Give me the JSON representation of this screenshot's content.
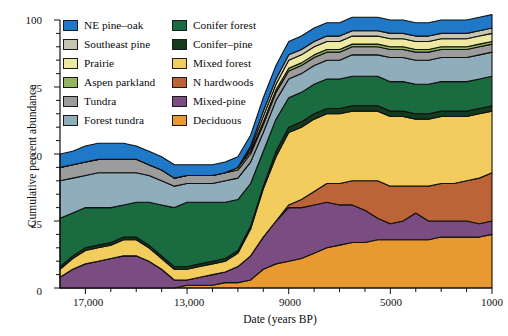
{
  "chart_data": {
    "type": "area",
    "title": "",
    "xlabel": "Date (years BP)",
    "ylabel": "Cumulative percent abundance",
    "xlim": [
      18000,
      1000
    ],
    "ylim": [
      0,
      100
    ],
    "x_reversed": true,
    "grid": false,
    "legend_position": "top-left-inside",
    "xticks": [
      17000,
      13000,
      9000,
      5000,
      1000
    ],
    "xtick_labels": [
      "17,000",
      "13,000",
      "9000",
      "5000",
      "1000"
    ],
    "xtick_minor_step": 1000,
    "yticks": [
      0,
      25,
      50,
      75,
      100
    ],
    "ytick_labels": [
      "0",
      "25",
      "50",
      "75",
      "100"
    ],
    "ytick_minor_step": 5,
    "x": [
      18000,
      17500,
      17000,
      16500,
      16000,
      15500,
      15000,
      14500,
      14000,
      13500,
      13000,
      12500,
      12000,
      11500,
      11000,
      10500,
      10000,
      9500,
      9000,
      8500,
      8000,
      7500,
      7000,
      6500,
      6000,
      5500,
      5000,
      4500,
      4000,
      3500,
      3000,
      2500,
      2000,
      1500,
      1000
    ],
    "stack_order_bottom_to_top": [
      "Deciduous",
      "Mixed-pine",
      "N hardwoods",
      "Mixed forest",
      "Conifer-pine",
      "Conifer forest",
      "Forest tundra",
      "Tundra",
      "Aspen parkland",
      "Prairie",
      "Southeast pine",
      "NE pine-oak"
    ],
    "series": [
      {
        "name": "Deciduous",
        "color": "#E89A30",
        "values": [
          0,
          0,
          0,
          0,
          0,
          0,
          0,
          0,
          0,
          0,
          1,
          1,
          1,
          2,
          2,
          3,
          7,
          9,
          10,
          11,
          13,
          15,
          16,
          17,
          17,
          18,
          18,
          18,
          18,
          18,
          19,
          19,
          19,
          19,
          20
        ]
      },
      {
        "name": "Mixed-pine",
        "color": "#7A4C82",
        "values": [
          4,
          7,
          9,
          10,
          11,
          12,
          12,
          10,
          7,
          3,
          2,
          3,
          4,
          4,
          6,
          9,
          12,
          16,
          20,
          19,
          18,
          17,
          15,
          14,
          12,
          8,
          6,
          7,
          10,
          7,
          6,
          6,
          6,
          5,
          5
        ]
      },
      {
        "name": "N hardwoods",
        "color": "#BC6437",
        "values": [
          0,
          0,
          0,
          0,
          0,
          0,
          0,
          0,
          0,
          0,
          0,
          0,
          0,
          0,
          0,
          0,
          0,
          0,
          1,
          3,
          5,
          7,
          8,
          9,
          11,
          14,
          14,
          13,
          10,
          13,
          14,
          14,
          15,
          17,
          18
        ]
      },
      {
        "name": "Mixed forest",
        "color": "#F2CC5C",
        "values": [
          3,
          4,
          5,
          5,
          5,
          6,
          6,
          5,
          4,
          4,
          4,
          4,
          4,
          4,
          5,
          10,
          18,
          24,
          27,
          27,
          27,
          26,
          26,
          26,
          26,
          26,
          26,
          26,
          25,
          25,
          25,
          25,
          24,
          24,
          23
        ]
      },
      {
        "name": "Conifer-pine",
        "color": "#123B1E",
        "values": [
          1,
          1,
          1,
          1,
          1,
          1,
          1,
          1,
          1,
          1,
          1,
          1,
          1,
          1,
          1,
          1,
          1,
          2,
          2,
          2,
          2,
          2,
          2,
          2,
          2,
          2,
          2,
          2,
          2,
          2,
          2,
          2,
          2,
          2,
          2
        ]
      },
      {
        "name": "Conifer forest",
        "color": "#1B6B41",
        "values": [
          18,
          16,
          15,
          14,
          13,
          12,
          13,
          16,
          19,
          22,
          24,
          23,
          22,
          21,
          19,
          16,
          13,
          12,
          11,
          11,
          11,
          11,
          11,
          11,
          11,
          11,
          11,
          11,
          11,
          11,
          11,
          11,
          11,
          11,
          11
        ]
      },
      {
        "name": "Forest tundra",
        "color": "#8FADBB",
        "values": [
          14,
          13,
          12,
          13,
          13,
          12,
          11,
          10,
          9,
          8,
          7,
          7,
          7,
          8,
          8,
          8,
          7,
          7,
          7,
          7,
          7,
          7,
          7,
          8,
          8,
          8,
          9,
          9,
          9,
          9,
          9,
          9,
          9,
          9,
          9
        ]
      },
      {
        "name": "Tundra",
        "color": "#9C9C9C",
        "values": [
          5,
          5,
          5,
          5,
          5,
          5,
          5,
          4,
          4,
          3,
          3,
          3,
          3,
          3,
          3,
          3,
          3,
          3,
          3,
          3,
          3,
          3,
          3,
          3,
          3,
          3,
          3,
          3,
          3,
          3,
          3,
          3,
          3,
          3,
          3
        ]
      },
      {
        "name": "Aspen parkland",
        "color": "#93B55F",
        "values": [
          0,
          0,
          0,
          0,
          0,
          0,
          0,
          0,
          0,
          0,
          0,
          0,
          0,
          0,
          1,
          1,
          1,
          1,
          1,
          1,
          1,
          1,
          1,
          1,
          1,
          1,
          1,
          1,
          1,
          1,
          1,
          1,
          1,
          1,
          1
        ]
      },
      {
        "name": "Prairie",
        "color": "#EEE9A0",
        "values": [
          0,
          0,
          0,
          0,
          0,
          0,
          0,
          0,
          0,
          0,
          0,
          0,
          0,
          0,
          0,
          1,
          2,
          2,
          3,
          3,
          3,
          3,
          3,
          3,
          3,
          3,
          3,
          3,
          3,
          3,
          3,
          3,
          3,
          3,
          3
        ]
      },
      {
        "name": "Southeast pine",
        "color": "#C8C4B4",
        "values": [
          0,
          0,
          0,
          0,
          0,
          0,
          0,
          0,
          0,
          0,
          0,
          0,
          0,
          0,
          0,
          1,
          2,
          2,
          2,
          2,
          2,
          2,
          2,
          2,
          2,
          2,
          2,
          2,
          2,
          2,
          2,
          2,
          2,
          2,
          2
        ]
      },
      {
        "name": "NE pine-oak",
        "color": "#1F78C8",
        "values": [
          5,
          5,
          6,
          6,
          6,
          6,
          5,
          5,
          5,
          5,
          4,
          4,
          4,
          4,
          4,
          4,
          5,
          5,
          5,
          5,
          5,
          5,
          5,
          5,
          5,
          5,
          5,
          5,
          5,
          5,
          5,
          5,
          5,
          5,
          5
        ]
      }
    ]
  },
  "legend": {
    "column_1": [
      {
        "label": "NE pine–oak",
        "color": "#1F78C8"
      },
      {
        "label": "Southeast pine",
        "color": "#C8C4B4"
      },
      {
        "label": "Prairie",
        "color": "#EEE9A0"
      },
      {
        "label": "Aspen parkland",
        "color": "#93B55F"
      },
      {
        "label": "Tundra",
        "color": "#9C9C9C"
      },
      {
        "label": "Forest tundra",
        "color": "#8FADBB"
      }
    ],
    "column_2": [
      {
        "label": "Conifer forest",
        "color": "#1B6B41"
      },
      {
        "label": "Conifer–pine",
        "color": "#123B1E"
      },
      {
        "label": "Mixed forest",
        "color": "#F2CC5C"
      },
      {
        "label": "N hardwoods",
        "color": "#BC6437"
      },
      {
        "label": "Mixed-pine",
        "color": "#7A4C82"
      },
      {
        "label": "Deciduous",
        "color": "#E89A30"
      }
    ]
  },
  "axes": {
    "y_title": "Cumulative percent abundance",
    "x_title": "Date (years BP)",
    "y_tick_labels": [
      "100",
      "75",
      "50",
      "25",
      "0"
    ],
    "x_tick_labels": [
      "17,000",
      "13,000",
      "9000",
      "5000",
      "1000"
    ]
  },
  "style": {
    "outline_color": "#111111",
    "axis_color": "#111111",
    "background": "#ffffff"
  }
}
